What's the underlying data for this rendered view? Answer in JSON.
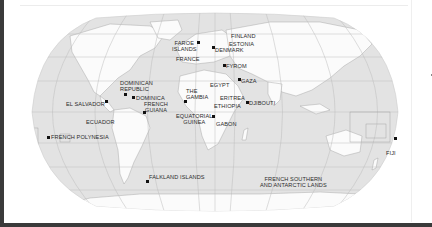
{
  "map": {
    "projection": "world-robinson-style",
    "colors": {
      "ocean": "#e3e3e3",
      "land": "#fbfbfb",
      "grid": "#bdbdbd",
      "border": "#9a9a9a",
      "marker": "#111111",
      "label": "#2b2b2b"
    },
    "locations": [
      {
        "name": "FAROE ISLANDS",
        "line1": "FAROE",
        "line2": "ISLANDS",
        "icon": "marker-dot"
      },
      {
        "name": "FINLAND",
        "line1": "FINLAND",
        "icon": "none"
      },
      {
        "name": "ESTONIA",
        "line1": "ESTONIA",
        "icon": "none"
      },
      {
        "name": "DENMARK",
        "line1": "DENMARK",
        "icon": "marker-dot"
      },
      {
        "name": "FRANCE",
        "line1": "FRANCE",
        "icon": "none"
      },
      {
        "name": "FYROM",
        "line1": "FYROM",
        "icon": "marker-dot"
      },
      {
        "name": "GAZA",
        "line1": "GAZA",
        "icon": "marker-dot"
      },
      {
        "name": "EGYPT",
        "line1": "EGYPT",
        "icon": "none"
      },
      {
        "name": "DOMINICAN REPUBLIC",
        "line1": "DOMINICAN",
        "line2": "REPUBLIC",
        "icon": "marker-dot"
      },
      {
        "name": "DOMINICA",
        "line1": "DOMINICA",
        "icon": "marker-dot"
      },
      {
        "name": "FRENCH GUIANA",
        "line1": "FRENCH",
        "line2": "GUIANA",
        "icon": "marker-dot"
      },
      {
        "name": "EL SALVADOR",
        "line1": "EL SALVADOR",
        "icon": "marker-dot"
      },
      {
        "name": "THE GAMBIA",
        "line1": "THE",
        "line2": "GAMBIA",
        "icon": "marker-dot"
      },
      {
        "name": "ERITREA",
        "line1": "ERITREA",
        "icon": "none"
      },
      {
        "name": "ETHIOPIA",
        "line1": "ETHIOPIA",
        "icon": "none"
      },
      {
        "name": "DJIBOUTI",
        "line1": "DJIBOUTI",
        "icon": "marker-dot"
      },
      {
        "name": "ECUADOR",
        "line1": "ECUADOR",
        "icon": "none"
      },
      {
        "name": "EQUATORIAL GUINEA",
        "line1": "EQUATORIAL",
        "line2": "GUINEA",
        "icon": "marker-dot"
      },
      {
        "name": "GABON",
        "line1": "GABON",
        "icon": "none"
      },
      {
        "name": "FRENCH POLYNESIA",
        "line1": "FRENCH POLYNESIA",
        "icon": "marker-dot"
      },
      {
        "name": "FALKLAND ISLANDS",
        "line1": "FALKLAND ISLANDS",
        "icon": "marker-dot"
      },
      {
        "name": "FRENCH SOUTHERN AND ANTARCTIC LANDS",
        "line1": "FRENCH SOUTHERN",
        "line2": "AND ANTARCTIC LANDS",
        "icon": "none"
      },
      {
        "name": "FIJI",
        "line1": "FIJI",
        "icon": "marker-dot"
      }
    ]
  }
}
